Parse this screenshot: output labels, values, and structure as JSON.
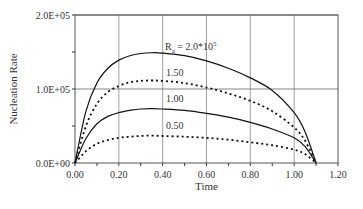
{
  "chart_data": {
    "type": "line",
    "title": "",
    "xlabel": "Time",
    "ylabel": "Nucleation Rate",
    "xlim": [
      0,
      1.2
    ],
    "ylim": [
      0,
      200000
    ],
    "x_ticks": [
      "0.00",
      "0.20",
      "0.40",
      "0.60",
      "0.80",
      "1.00",
      "1.20"
    ],
    "y_ticks": [
      "0.0E+00",
      "1.0E+05",
      "2.0E+05"
    ],
    "grid": true,
    "x": [
      0,
      0.05,
      0.1,
      0.15,
      0.2,
      0.25,
      0.3,
      0.35,
      0.4,
      0.5,
      0.6,
      0.7,
      0.8,
      0.9,
      1.0,
      1.05,
      1.1
    ],
    "series": [
      {
        "name": "Ra = 2.0*10^5",
        "style": "solid",
        "values": [
          0,
          70000,
          108000,
          128000,
          139000,
          145000,
          148000,
          149000,
          148500,
          145000,
          138000,
          128000,
          115000,
          98000,
          68000,
          42000,
          0
        ]
      },
      {
        "name": "1.50",
        "style": "dotted",
        "values": [
          0,
          50000,
          80000,
          96000,
          104000,
          109000,
          111000,
          111500,
          111000,
          108000,
          102000,
          94000,
          84000,
          70000,
          48000,
          30000,
          0
        ]
      },
      {
        "name": "1.00",
        "style": "solid",
        "values": [
          0,
          33000,
          53000,
          63000,
          68000,
          71000,
          73000,
          73500,
          73000,
          71000,
          67000,
          62000,
          55000,
          46000,
          34000,
          22000,
          0
        ]
      },
      {
        "name": "0.50",
        "style": "dotted",
        "values": [
          0,
          16000,
          26000,
          31000,
          34000,
          35500,
          36500,
          37000,
          36500,
          35500,
          34000,
          31500,
          28000,
          24000,
          18000,
          12000,
          0
        ]
      }
    ],
    "annotations": [
      {
        "text_main": "R",
        "text_sub": "a",
        "text_rest": " = 2.0*10",
        "text_sup": "5"
      },
      {
        "text": "1.50"
      },
      {
        "text": "1.00"
      },
      {
        "text": "0.50"
      }
    ]
  }
}
